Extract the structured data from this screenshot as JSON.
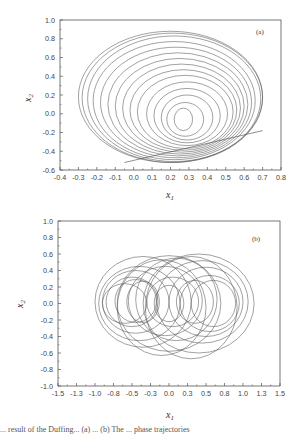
{
  "chart_data": [
    {
      "type": "line",
      "panel_label": "(a)",
      "title": "",
      "xlabel": "x",
      "xlabel_sub": "1",
      "ylabel": "x",
      "ylabel_sub": "2",
      "xlim": [
        -0.4,
        0.8
      ],
      "ylim": [
        -0.6,
        1.0
      ],
      "xticks": [
        "-0.4",
        "-0.3",
        "-0.2",
        "-0.1",
        "0.0",
        "0.1",
        "0.2",
        "0.3",
        "0.4",
        "0.5",
        "0.6",
        "0.7",
        "0.8"
      ],
      "yticks": [
        "-0.6",
        "-0.4",
        "-0.2",
        "0.0",
        "0.2",
        "0.4",
        "0.6",
        "0.8",
        "1.0"
      ],
      "grid": false,
      "legend": null,
      "description": "Phase portrait: nested loops sharing a common lower tangent line; outermost loop spans x1 from about -0.3 to 0.7, x2 from about -0.52 to 0.88; innermost loop centered near x1=0.27, x2=-0.05",
      "loops": [
        {
          "cx": 0.2,
          "cy": 0.18,
          "rx": 0.5,
          "ry": 0.7
        },
        {
          "cx": 0.21,
          "cy": 0.17,
          "rx": 0.49,
          "ry": 0.69
        },
        {
          "cx": 0.22,
          "cy": 0.16,
          "rx": 0.47,
          "ry": 0.67
        },
        {
          "cx": 0.22,
          "cy": 0.14,
          "rx": 0.44,
          "ry": 0.63
        },
        {
          "cx": 0.23,
          "cy": 0.12,
          "rx": 0.41,
          "ry": 0.59
        },
        {
          "cx": 0.24,
          "cy": 0.1,
          "rx": 0.38,
          "ry": 0.55
        },
        {
          "cx": 0.25,
          "cy": 0.08,
          "rx": 0.35,
          "ry": 0.51
        },
        {
          "cx": 0.26,
          "cy": 0.06,
          "rx": 0.32,
          "ry": 0.47
        },
        {
          "cx": 0.27,
          "cy": 0.04,
          "rx": 0.29,
          "ry": 0.43
        },
        {
          "cx": 0.28,
          "cy": 0.02,
          "rx": 0.26,
          "ry": 0.39
        },
        {
          "cx": 0.29,
          "cy": 0.0,
          "rx": 0.22,
          "ry": 0.34
        },
        {
          "cx": 0.29,
          "cy": -0.02,
          "rx": 0.18,
          "ry": 0.29
        },
        {
          "cx": 0.29,
          "cy": -0.04,
          "rx": 0.14,
          "ry": 0.24
        },
        {
          "cx": 0.28,
          "cy": -0.06,
          "rx": 0.1,
          "ry": 0.18
        },
        {
          "cx": 0.27,
          "cy": -0.06,
          "rx": 0.05,
          "ry": 0.12
        }
      ]
    },
    {
      "type": "line",
      "panel_label": "(b)",
      "title": "",
      "xlabel": "x",
      "xlabel_sub": "1",
      "ylabel": "x",
      "ylabel_sub": "2",
      "xlim": [
        -1.5,
        1.5
      ],
      "ylim": [
        -1.0,
        1.0
      ],
      "xticks": [
        "-1.5",
        "-1.3",
        "-1.0",
        "-0.8",
        "-0.5",
        "-0.3",
        "0.0",
        "0.3",
        "0.5",
        "0.8",
        "1.0",
        "1.3",
        "1.5"
      ],
      "yticks": [
        "-1.0",
        "-0.8",
        "-0.6",
        "-0.4",
        "-0.2",
        "0.0",
        "0.2",
        "0.4",
        "0.6",
        "0.8",
        "1.0"
      ],
      "grid": false,
      "legend": null,
      "description": "Phase portrait: many overlapping circles/ellipses roughly symmetric about x1=0, spanning x1 about -1.05 to 1.15 and x2 about -0.65 to 0.62",
      "loops": [
        {
          "cx": -0.35,
          "cy": 0.02,
          "rx": 0.65,
          "ry": 0.55
        },
        {
          "cx": -0.4,
          "cy": 0.0,
          "rx": 0.55,
          "ry": 0.45
        },
        {
          "cx": -0.45,
          "cy": 0.02,
          "rx": 0.45,
          "ry": 0.38
        },
        {
          "cx": -0.5,
          "cy": 0.02,
          "rx": 0.35,
          "ry": 0.3
        },
        {
          "cx": -0.45,
          "cy": 0.03,
          "rx": 0.28,
          "ry": 0.26
        },
        {
          "cx": -0.35,
          "cy": 0.02,
          "rx": 0.22,
          "ry": 0.25
        },
        {
          "cx": -0.6,
          "cy": 0.0,
          "rx": 0.3,
          "ry": 0.24
        },
        {
          "cx": 0.4,
          "cy": 0.0,
          "rx": 0.75,
          "ry": 0.6
        },
        {
          "cx": 0.45,
          "cy": 0.02,
          "rx": 0.62,
          "ry": 0.5
        },
        {
          "cx": 0.5,
          "cy": 0.02,
          "rx": 0.5,
          "ry": 0.42
        },
        {
          "cx": 0.55,
          "cy": 0.0,
          "rx": 0.4,
          "ry": 0.34
        },
        {
          "cx": 0.6,
          "cy": 0.0,
          "rx": 0.3,
          "ry": 0.28
        },
        {
          "cx": 0.35,
          "cy": 0.02,
          "rx": 0.25,
          "ry": 0.26
        },
        {
          "cx": 0.0,
          "cy": 0.0,
          "rx": 0.2,
          "ry": 0.22
        },
        {
          "cx": 0.05,
          "cy": 0.02,
          "rx": 0.35,
          "ry": 0.3
        },
        {
          "cx": -0.05,
          "cy": 0.03,
          "rx": 0.5,
          "ry": 0.42
        },
        {
          "cx": 0.1,
          "cy": 0.05,
          "rx": 0.55,
          "ry": 0.5
        },
        {
          "cx": 0.0,
          "cy": 0.0,
          "rx": 0.7,
          "ry": 0.58
        },
        {
          "cx": -0.1,
          "cy": -0.05,
          "rx": 0.6,
          "ry": 0.58
        },
        {
          "cx": 0.3,
          "cy": -0.05,
          "rx": 0.62,
          "ry": 0.62
        }
      ]
    }
  ],
  "caption": "... result of the Duffing... (a) ... (b) The ... phase trajectories"
}
